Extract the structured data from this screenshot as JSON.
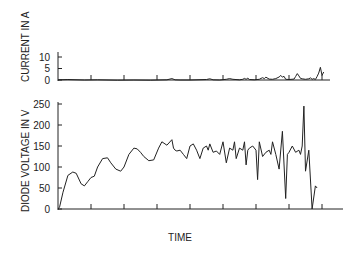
{
  "chart_data": [
    {
      "type": "line",
      "title": "",
      "xlabel": "",
      "ylabel": "CURRENT IN A",
      "ylim": [
        0,
        12
      ],
      "yticks": [
        0,
        5,
        10
      ],
      "xlim": [
        0,
        8.1
      ],
      "xticks": [
        1,
        2,
        3,
        4,
        5,
        6,
        7,
        8
      ],
      "grid": false,
      "series": [
        {
          "name": "current",
          "x": [
            0,
            0.3,
            0.8,
            1.2,
            1.8,
            2.3,
            2.8,
            3.3,
            3.45,
            3.55,
            3.7,
            4.0,
            4.5,
            4.6,
            4.7,
            4.9,
            5.1,
            5.2,
            5.3,
            5.5,
            5.6,
            5.65,
            5.7,
            5.75,
            5.8,
            5.95,
            6.1,
            6.15,
            6.2,
            6.25,
            6.3,
            6.4,
            6.5,
            6.6,
            6.7,
            6.75,
            6.8,
            6.85,
            6.9,
            7.0,
            7.15,
            7.2,
            7.25,
            7.3,
            7.35,
            7.4,
            7.5,
            7.6,
            7.65,
            7.7,
            7.75,
            7.8,
            7.85,
            7.9,
            7.95,
            8.0,
            8.05
          ],
          "y": [
            0.1,
            0.2,
            0.0,
            0.1,
            -0.1,
            0.0,
            -0.1,
            0.1,
            0.6,
            0.1,
            0.0,
            0.0,
            0.2,
            0.5,
            0.1,
            0.0,
            0.3,
            0.6,
            0.3,
            0.1,
            0.3,
            0.7,
            0.3,
            0.8,
            0.2,
            0.1,
            0.3,
            0.7,
            1.0,
            0.6,
            1.2,
            0.4,
            0.3,
            0.6,
            1.3,
            2.0,
            1.2,
            1.6,
            0.3,
            0.2,
            0.4,
            1.5,
            2.8,
            1.8,
            0.7,
            0.5,
            0.3,
            0.5,
            0.9,
            0.3,
            0.6,
            0.2,
            1.5,
            3.0,
            5.5,
            2.0,
            3.5
          ]
        }
      ]
    },
    {
      "type": "line",
      "title": "",
      "xlabel": "TIME",
      "ylabel": "DIODE VOLTAGE IN V",
      "ylim": [
        0,
        250
      ],
      "yticks": [
        0,
        50,
        100,
        150,
        200,
        250
      ],
      "xlim": [
        0,
        8.1
      ],
      "xticks": [
        1,
        2,
        3,
        4,
        5,
        6,
        7,
        8
      ],
      "grid": false,
      "series": [
        {
          "name": "diode voltage",
          "x": [
            0,
            0.05,
            0.15,
            0.3,
            0.45,
            0.55,
            0.7,
            0.8,
            0.9,
            1.0,
            1.1,
            1.2,
            1.35,
            1.5,
            1.6,
            1.75,
            1.9,
            2.0,
            2.15,
            2.3,
            2.4,
            2.5,
            2.6,
            2.75,
            2.9,
            3.05,
            3.15,
            3.3,
            3.45,
            3.5,
            3.55,
            3.6,
            3.7,
            3.8,
            3.9,
            4.0,
            4.1,
            4.2,
            4.3,
            4.4,
            4.5,
            4.55,
            4.6,
            4.7,
            4.8,
            4.9,
            5.0,
            5.1,
            5.2,
            5.3,
            5.35,
            5.4,
            5.5,
            5.6,
            5.65,
            5.7,
            5.75,
            5.8,
            5.9,
            6.0,
            6.05,
            6.1,
            6.2,
            6.3,
            6.4,
            6.45,
            6.5,
            6.6,
            6.7,
            6.8,
            6.9,
            6.95,
            7.0,
            7.1,
            7.2,
            7.3,
            7.35,
            7.4,
            7.45,
            7.5,
            7.6,
            7.7,
            7.8,
            7.85,
            7.9,
            7.95,
            8.0,
            8.02,
            8.05
          ],
          "y": [
            0,
            5,
            40,
            80,
            88,
            85,
            60,
            55,
            65,
            75,
            78,
            100,
            120,
            122,
            110,
            95,
            90,
            100,
            130,
            145,
            143,
            135,
            125,
            115,
            117,
            145,
            160,
            152,
            165,
            145,
            140,
            138,
            140,
            130,
            120,
            150,
            155,
            140,
            120,
            145,
            150,
            140,
            155,
            135,
            138,
            130,
            160,
            110,
            145,
            140,
            160,
            120,
            145,
            140,
            160,
            105,
            140,
            145,
            150,
            140,
            70,
            160,
            125,
            135,
            140,
            130,
            160,
            130,
            95,
            185,
            25,
            130,
            135,
            150,
            135,
            140,
            130,
            150,
            245,
            90,
            140,
            0,
            55,
            50
          ],
          "note": "final spike reaches ~250 V and drops below 0 near t≈8"
        }
      ]
    }
  ],
  "labels": {
    "top_ylabel": "CURRENT IN A",
    "bottom_ylabel": "DIODE VOLTAGE IN V",
    "xlabel": "TIME",
    "top_ticks": [
      "0",
      "5",
      "10"
    ],
    "bottom_ticks": [
      "0",
      "50",
      "100",
      "150",
      "200",
      "250"
    ]
  }
}
